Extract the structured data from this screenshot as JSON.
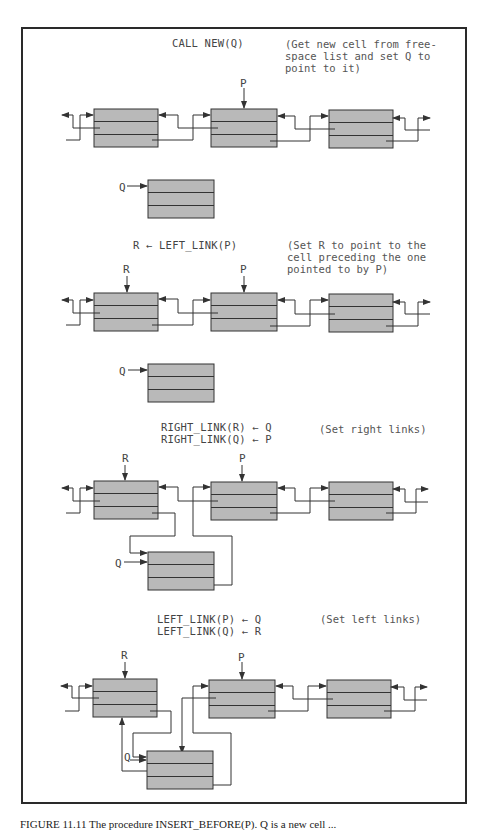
{
  "figure": {
    "panels": [
      {
        "operation": [
          "CALL NEW(Q)"
        ],
        "note": "(Get new cell from free-\nspace list and set Q to\npoint to it)",
        "pointers": {
          "P": "P",
          "Q": "Q"
        }
      },
      {
        "operation": [
          "R ← LEFT_LINK(P)"
        ],
        "note": "(Set R to point to the\ncell preceding the one\npointed to by P)",
        "pointers": {
          "R": "R",
          "P": "P",
          "Q": "Q"
        }
      },
      {
        "operation": [
          "RIGHT_LINK(R) ← Q",
          "RIGHT_LINK(Q) ← P"
        ],
        "note": "(Set right links)",
        "pointers": {
          "R": "R",
          "P": "P",
          "Q": "Q"
        }
      },
      {
        "operation": [
          "LEFT_LINK(P) ← Q",
          "LEFT_LINK(Q) ← R"
        ],
        "note": "(Set left links)",
        "pointers": {
          "R": "R",
          "P": "P",
          "Q": "Q"
        }
      }
    ],
    "colors": {
      "cell_fill": "#b9b9b9",
      "line": "#333333",
      "frame": "#2a2a2a"
    },
    "caption": "FIGURE 11.11  The procedure INSERT_BEFORE(P). Q is a new cell ..."
  }
}
